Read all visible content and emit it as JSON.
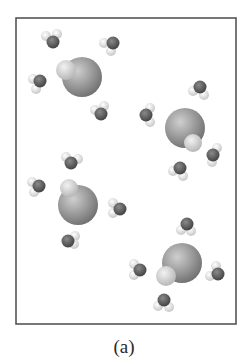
{
  "figure": {
    "caption": "(a)",
    "frame": {
      "x": 16,
      "y": 18,
      "width": 220,
      "height": 306,
      "stroke": "#555555"
    },
    "colors": {
      "ion_light": "#cfcfcf",
      "ion_mid": "#9a9a9a",
      "ion_dark": "#6e6e6e",
      "oxygen_light": "#8a8a8a",
      "oxygen_dark": "#3e3e3e",
      "hydrogen_light": "#ffffff",
      "hydrogen_dark": "#c4c4c4"
    },
    "ion_pairs": [
      {
        "label": "ion-pair-1",
        "cx": 82,
        "cy": 77,
        "r": 20,
        "bump": {
          "cx": 66,
          "cy": 70,
          "r": 10
        }
      },
      {
        "label": "ion-pair-2",
        "cx": 185,
        "cy": 128,
        "r": 20,
        "bump": {
          "cx": 193,
          "cy": 143,
          "r": 9
        }
      },
      {
        "label": "ion-pair-3",
        "cx": 78,
        "cy": 205,
        "r": 20,
        "bump": {
          "cx": 69,
          "cy": 188,
          "r": 9
        }
      },
      {
        "label": "ion-pair-4",
        "cx": 182,
        "cy": 263,
        "r": 20,
        "bump": {
          "cx": 166,
          "cy": 276,
          "r": 10
        }
      }
    ],
    "water_molecules": [
      {
        "ox": 53,
        "oy": 42,
        "h1x": 46,
        "h1y": 36,
        "h2x": 57,
        "h2y": 34
      },
      {
        "ox": 113,
        "oy": 43,
        "h1x": 104,
        "h1y": 43,
        "h2x": 111,
        "h2y": 51
      },
      {
        "ox": 40,
        "oy": 81,
        "h1x": 33,
        "h1y": 79,
        "h2x": 36,
        "h2y": 89
      },
      {
        "ox": 101,
        "oy": 114,
        "h1x": 95,
        "h1y": 110,
        "h2x": 104,
        "h2y": 106
      },
      {
        "ox": 200,
        "oy": 87,
        "h1x": 193,
        "h1y": 91,
        "h2x": 204,
        "h2y": 95
      },
      {
        "ox": 146,
        "oy": 115,
        "h1x": 150,
        "h1y": 108,
        "h2x": 150,
        "h2y": 122
      },
      {
        "ox": 213,
        "oy": 155,
        "h1x": 217,
        "h1y": 148,
        "h2x": 212,
        "h2y": 162
      },
      {
        "ox": 180,
        "oy": 168,
        "h1x": 173,
        "h1y": 171,
        "h2x": 183,
        "h2y": 176
      },
      {
        "ox": 71,
        "oy": 163,
        "h1x": 66,
        "h1y": 157,
        "h2x": 78,
        "h2y": 159
      },
      {
        "ox": 39,
        "oy": 186,
        "h1x": 32,
        "h1y": 182,
        "h2x": 34,
        "h2y": 192
      },
      {
        "ox": 120,
        "oy": 209,
        "h1x": 113,
        "h1y": 203,
        "h2x": 113,
        "h2y": 213
      },
      {
        "ox": 68,
        "oy": 241,
        "h1x": 75,
        "h1y": 236,
        "h2x": 74,
        "h2y": 244
      },
      {
        "ox": 187,
        "oy": 224,
        "h1x": 181,
        "h1y": 230,
        "h2x": 191,
        "h2y": 231
      },
      {
        "ox": 140,
        "oy": 270,
        "h1x": 134,
        "h1y": 264,
        "h2x": 134,
        "h2y": 275
      },
      {
        "ox": 218,
        "oy": 274,
        "h1x": 216,
        "h1y": 266,
        "h2x": 210,
        "h2y": 276
      },
      {
        "ox": 164,
        "oy": 300,
        "h1x": 158,
        "h1y": 306,
        "h2x": 169,
        "h2y": 307
      }
    ]
  }
}
